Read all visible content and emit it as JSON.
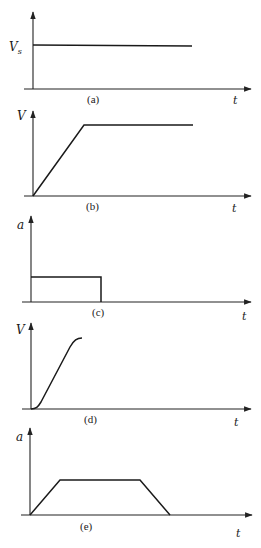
{
  "figure": {
    "panels": [
      {
        "id": "a",
        "caption": "(a)",
        "y_label": "V",
        "y_label_sub": "s",
        "x_label": "t",
        "description": "Constant velocity V_s step",
        "shape": "constant"
      },
      {
        "id": "b",
        "caption": "(b)",
        "y_label": "V",
        "x_label": "t",
        "description": "Velocity ramps linearly then holds constant",
        "shape": "ramp-plateau"
      },
      {
        "id": "c",
        "caption": "(c)",
        "y_label": "a",
        "x_label": "t",
        "description": "Constant acceleration pulse then zero",
        "shape": "rectangular-pulse"
      },
      {
        "id": "d",
        "caption": "(d)",
        "y_label": "V",
        "x_label": "t",
        "description": "S-curve velocity rise with smooth start and end",
        "shape": "s-curve"
      },
      {
        "id": "e",
        "caption": "(e)",
        "y_label": "a",
        "x_label": "t",
        "description": "Trapezoidal acceleration profile",
        "shape": "trapezoid"
      }
    ]
  }
}
